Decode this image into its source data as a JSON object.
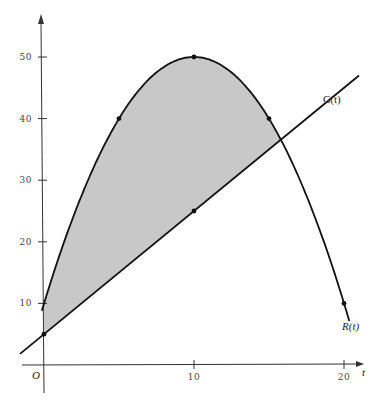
{
  "chart_data": {
    "type": "area",
    "title": "",
    "xlabel": "t",
    "ylabel": "",
    "origin_label": "O",
    "xlim": [
      0,
      21
    ],
    "ylim": [
      0,
      55
    ],
    "x_ticks": [
      {
        "value": 10,
        "label": "10"
      },
      {
        "value": 20,
        "label": "20"
      }
    ],
    "y_ticks": [
      {
        "value": 10,
        "label": "10"
      },
      {
        "value": 20,
        "label": "20"
      },
      {
        "value": 30,
        "label": "30"
      },
      {
        "value": 40,
        "label": "40"
      },
      {
        "value": 50,
        "label": "50"
      }
    ],
    "grid": false,
    "series": [
      {
        "name": "R(t)",
        "label": "R(t)",
        "kind": "curve",
        "x": [
          0,
          5,
          10,
          15,
          20
        ],
        "values": [
          10,
          40,
          50,
          40,
          10
        ],
        "marked_points": [
          [
            5,
            40
          ],
          [
            10,
            50
          ],
          [
            15,
            40
          ],
          [
            20,
            10
          ]
        ]
      },
      {
        "name": "C(t)",
        "label": "C(t)",
        "kind": "line",
        "x": [
          0,
          10
        ],
        "values": [
          5,
          25
        ],
        "marked_points": [
          [
            0,
            5
          ],
          [
            10,
            25
          ]
        ]
      }
    ],
    "shaded_region": {
      "description": "Area between R(t) (above) and C(t) (below) from t=0 to intersection near t≈15.5",
      "fill": "#c8c8c8"
    }
  },
  "colors": {
    "axis": "#333333",
    "curve": "#111111",
    "fill": "#c8c8c8"
  }
}
